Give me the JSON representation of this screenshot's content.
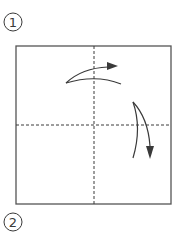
{
  "diagram": {
    "type": "origami-instruction",
    "steps": [
      {
        "number": "1",
        "center": [
          13,
          22
        ]
      },
      {
        "number": "2",
        "center": [
          13,
          222
        ]
      }
    ],
    "paper_square": {
      "x": 16,
      "y": 46,
      "width": 155,
      "height": 158
    },
    "fold_lines": [
      {
        "name": "vertical-valley-fold",
        "style": "dashed",
        "x": 94
      },
      {
        "name": "horizontal-valley-fold",
        "style": "dashed",
        "y": 125
      }
    ],
    "arrows": [
      {
        "name": "fold-right-arrow",
        "direction": "right"
      },
      {
        "name": "fold-down-arrow",
        "direction": "down"
      }
    ],
    "colors": {
      "line": "#3a3a3a",
      "background": "#ffffff"
    }
  }
}
